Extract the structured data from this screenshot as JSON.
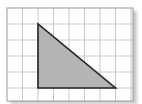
{
  "diagram": {
    "type": "grid-with-shape",
    "grid": {
      "columns": 8,
      "rows": 6,
      "origin": [
        7,
        8
      ],
      "cell_width": 15.5,
      "cell_height": 16,
      "width": 126,
      "height": 93,
      "line_color": "#c8c8c8",
      "border_color": "#9a9a9a",
      "background": "#ffffff"
    },
    "shape": {
      "kind": "right-triangle",
      "vertices_grid": [
        [
          2,
          1
        ],
        [
          2,
          5
        ],
        [
          7,
          5
        ]
      ],
      "base_units": 5,
      "height_units": 4,
      "fill": "#b4b4b4",
      "stroke": "#222222"
    }
  }
}
